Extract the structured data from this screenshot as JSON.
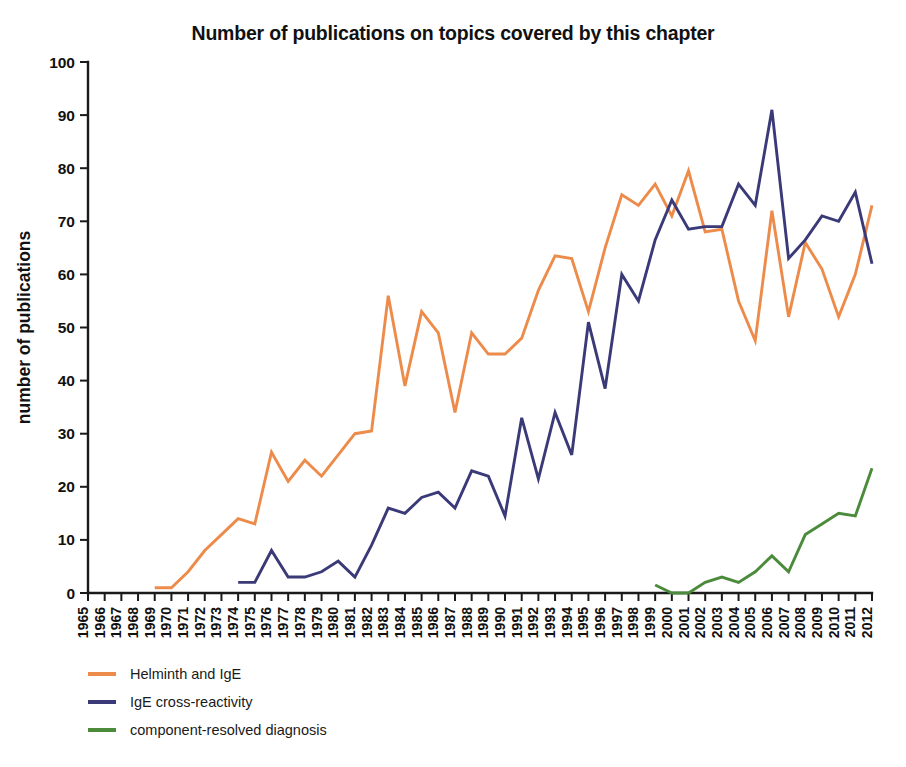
{
  "chart_data": {
    "type": "line",
    "title": "Number of publications on topics covered by this chapter",
    "xlabel": "",
    "ylabel": "number of publications",
    "ylim": [
      0,
      100
    ],
    "ytick_step": 10,
    "yticks": [
      0,
      10,
      20,
      30,
      40,
      50,
      60,
      70,
      80,
      90,
      100
    ],
    "grid": false,
    "legend_position": "below-left",
    "x": [
      1965,
      1966,
      1967,
      1968,
      1969,
      1970,
      1971,
      1972,
      1973,
      1974,
      1975,
      1976,
      1977,
      1978,
      1979,
      1980,
      1981,
      1982,
      1983,
      1984,
      1985,
      1986,
      1987,
      1988,
      1989,
      1990,
      1991,
      1992,
      1993,
      1994,
      1995,
      1996,
      1997,
      1998,
      1999,
      2000,
      2001,
      2002,
      2003,
      2004,
      2005,
      2006,
      2007,
      2008,
      2009,
      2010,
      2011,
      2012
    ],
    "categories": [
      "1965",
      "1966",
      "1967",
      "1968",
      "1969",
      "1970",
      "1971",
      "1972",
      "1973",
      "1974",
      "1975",
      "1976",
      "1977",
      "1978",
      "1979",
      "1980",
      "1981",
      "1982",
      "1983",
      "1984",
      "1985",
      "1986",
      "1987",
      "1988",
      "1989",
      "1990",
      "1991",
      "1992",
      "1993",
      "1994",
      "1995",
      "1996",
      "1997",
      "1998",
      "1999",
      "2000",
      "2001",
      "2002",
      "2003",
      "2004",
      "2005",
      "2006",
      "2007",
      "2008",
      "2009",
      "2010",
      "2011",
      "2012"
    ],
    "series": [
      {
        "name": "Helminth and IgE",
        "color": "#ED8B4B",
        "start_year": 1969,
        "values": [
          null,
          null,
          null,
          null,
          1,
          1,
          4,
          8,
          11,
          14,
          13,
          26.5,
          21,
          25,
          22,
          26,
          30,
          30.5,
          56,
          39,
          53,
          49,
          34,
          49,
          45,
          45,
          48,
          57,
          63.5,
          63,
          53,
          65,
          75,
          73,
          77,
          71,
          79.5,
          68,
          68.5,
          55,
          47.5,
          72,
          52,
          66,
          61,
          52,
          60,
          73
        ]
      },
      {
        "name": "IgE cross-reactivity",
        "color": "#3A3A78",
        "start_year": 1974,
        "values": [
          null,
          null,
          null,
          null,
          null,
          null,
          null,
          null,
          null,
          2,
          2,
          8,
          3,
          3,
          4,
          6,
          3,
          9,
          16,
          15,
          18,
          19,
          16,
          23,
          22,
          14.5,
          33,
          21.5,
          34,
          26,
          51,
          38.5,
          60,
          55,
          66.5,
          74,
          68.5,
          69,
          69,
          77,
          73,
          91,
          63,
          66.5,
          71,
          70,
          75.5,
          62
        ]
      },
      {
        "name": "component-resolved diagnosis",
        "color": "#4B8B3B",
        "start_year": 1999,
        "values": [
          null,
          null,
          null,
          null,
          null,
          null,
          null,
          null,
          null,
          null,
          null,
          null,
          null,
          null,
          null,
          null,
          null,
          null,
          null,
          null,
          null,
          null,
          null,
          null,
          null,
          null,
          null,
          null,
          null,
          null,
          null,
          null,
          null,
          null,
          1.5,
          0,
          0,
          2,
          3,
          2,
          4,
          7,
          4,
          11,
          13,
          15,
          14.5,
          23.5
        ]
      }
    ]
  },
  "legend": {
    "items": [
      {
        "label": "Helminth and IgE",
        "color": "#ED8B4B"
      },
      {
        "label": "IgE cross-reactivity",
        "color": "#3A3A78"
      },
      {
        "label": "component-resolved diagnosis",
        "color": "#4B8B3B"
      }
    ]
  }
}
